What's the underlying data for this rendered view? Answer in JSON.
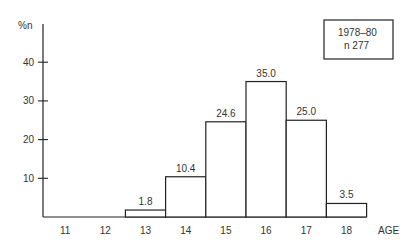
{
  "chart_data": {
    "type": "bar",
    "title": "",
    "xlabel": "AGE",
    "ylabel": "%n",
    "categories": [
      "11",
      "12",
      "13",
      "14",
      "15",
      "16",
      "17",
      "18"
    ],
    "values": [
      0,
      0,
      1.8,
      10.4,
      24.6,
      35.0,
      25.0,
      3.5
    ],
    "value_labels": [
      "",
      "",
      "1.8",
      "10.4",
      "24.6",
      "35.0",
      "25.0",
      "3.5"
    ],
    "yticks": [
      10,
      20,
      30,
      40
    ],
    "ytick_labels": [
      "10",
      "20",
      "30",
      "40"
    ],
    "ylim": [
      0,
      48
    ],
    "grid": false,
    "legend": {
      "position": "top-right",
      "lines": [
        "1978–80",
        "n 277"
      ]
    }
  },
  "legend_box": {
    "line1": "1978–80",
    "line2": "n 277"
  },
  "axis": {
    "y_label": "%n",
    "x_label": "AGE"
  }
}
